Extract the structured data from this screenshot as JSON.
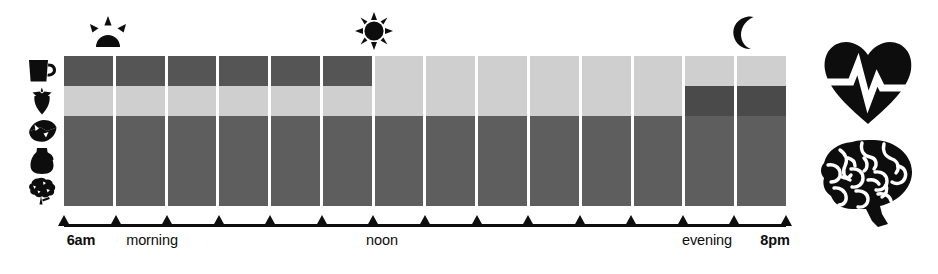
{
  "figure": {
    "title_visible": false,
    "background": "#ffffff",
    "ink": "#0d0d0d"
  },
  "celestial_markers": [
    {
      "name": "sunrise-icon",
      "label": "sunrise",
      "x": 104,
      "y": 18
    },
    {
      "name": "sun-icon",
      "label": "noon sun",
      "x": 373,
      "y": 14
    },
    {
      "name": "moon-icon",
      "label": "crescent moon",
      "x": 744,
      "y": 18
    }
  ],
  "row_icons": [
    {
      "name": "coffee-mug-icon",
      "label": "coffee"
    },
    {
      "name": "strawberry-icon",
      "label": "fruit"
    },
    {
      "name": "cheese-icon",
      "label": "cheese"
    },
    {
      "name": "pitcher-icon",
      "label": "milk pitcher"
    },
    {
      "name": "broccoli-icon",
      "label": "vegetable"
    }
  ],
  "organ_icons": [
    {
      "name": "heart-pulse-icon",
      "label": "heart"
    },
    {
      "name": "brain-icon",
      "label": "brain"
    }
  ],
  "axis": {
    "tick_count": 15,
    "labels": [
      {
        "text": "6am",
        "bold": true,
        "x": 81
      },
      {
        "text": "morning",
        "bold": false,
        "x": 152
      },
      {
        "text": "noon",
        "bold": false,
        "x": 382
      },
      {
        "text": "evening",
        "bold": false,
        "x": 707
      },
      {
        "text": "8pm",
        "bold": true,
        "x": 775
      }
    ]
  },
  "chart_data": {
    "type": "heatmap",
    "title": "",
    "xlabel": "",
    "ylabel": "",
    "grid": false,
    "legend": "none",
    "columns": 14,
    "categories": [
      "6am",
      "7am",
      "8am",
      "9am",
      "10am",
      "11am",
      "noon",
      "1pm",
      "2pm",
      "3pm",
      "4pm",
      "5pm",
      "6pm",
      "7pm"
    ],
    "row_labels": [
      "coffee",
      "fruit",
      "cheese",
      "milk pitcher",
      "vegetable"
    ],
    "colors": {
      "dark": "#555555",
      "darker": "#4a4a4a",
      "mid": "#5e5e5e",
      "light": "#cfcfcf"
    },
    "series": [
      {
        "name": "coffee",
        "values": [
          "#555555",
          "#555555",
          "#555555",
          "#555555",
          "#555555",
          "#555555",
          "#cfcfcf",
          "#cfcfcf",
          "#cfcfcf",
          "#cfcfcf",
          "#cfcfcf",
          "#cfcfcf",
          "#cfcfcf",
          "#cfcfcf"
        ]
      },
      {
        "name": "fruit",
        "values": [
          "#cfcfcf",
          "#cfcfcf",
          "#cfcfcf",
          "#cfcfcf",
          "#cfcfcf",
          "#cfcfcf",
          "#cfcfcf",
          "#cfcfcf",
          "#cfcfcf",
          "#cfcfcf",
          "#cfcfcf",
          "#cfcfcf",
          "#4a4a4a",
          "#4a4a4a"
        ]
      },
      {
        "name": "cheese",
        "values": [
          "#5e5e5e",
          "#5e5e5e",
          "#5e5e5e",
          "#5e5e5e",
          "#5e5e5e",
          "#5e5e5e",
          "#5e5e5e",
          "#5e5e5e",
          "#5e5e5e",
          "#5e5e5e",
          "#5e5e5e",
          "#5e5e5e",
          "#5e5e5e",
          "#5e5e5e"
        ]
      },
      {
        "name": "milk pitcher",
        "values": [
          "#5e5e5e",
          "#5e5e5e",
          "#5e5e5e",
          "#5e5e5e",
          "#5e5e5e",
          "#5e5e5e",
          "#5e5e5e",
          "#5e5e5e",
          "#5e5e5e",
          "#5e5e5e",
          "#5e5e5e",
          "#5e5e5e",
          "#5e5e5e",
          "#5e5e5e"
        ]
      },
      {
        "name": "vegetable",
        "values": [
          "#5e5e5e",
          "#5e5e5e",
          "#5e5e5e",
          "#5e5e5e",
          "#5e5e5e",
          "#5e5e5e",
          "#5e5e5e",
          "#5e5e5e",
          "#5e5e5e",
          "#5e5e5e",
          "#5e5e5e",
          "#5e5e5e",
          "#5e5e5e",
          "#5e5e5e"
        ]
      }
    ]
  }
}
